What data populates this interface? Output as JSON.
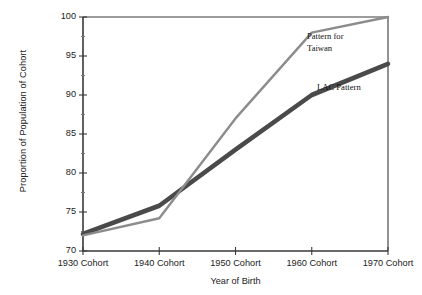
{
  "chart_data": {
    "type": "line",
    "title": "",
    "subtitle": "",
    "xlabel": "Year of Birth",
    "ylabel": "Proportion of Population of Cohort",
    "categories": [
      "1930 Cohort",
      "1940 Cohort",
      "1950 Cohort",
      "1960 Cohort",
      "1970 Cohort"
    ],
    "x_tick_labels": [
      "1930 Cohort",
      "1940 Cohort",
      "1950 Cohort",
      "1960 Cohort",
      "1970 Cohort"
    ],
    "y_tick_labels": [
      "70",
      "75",
      "80",
      "85",
      "90",
      "95",
      "100"
    ],
    "y_tick_values": [
      70,
      75,
      80,
      85,
      90,
      95,
      100
    ],
    "y_minor_tick_values": [
      72.5,
      77.5,
      82.5,
      87.5,
      92.5,
      97.5
    ],
    "ylim": [
      70,
      100
    ],
    "xlim": [
      0,
      4
    ],
    "grid": false,
    "legend_position": "inline-annotation",
    "series": [
      {
        "name": "Pattern for Taiwan",
        "label_lines": [
          "Pattern for",
          "Taiwan"
        ],
        "color": "#8c8c8c",
        "line_width": 2.4,
        "values": [
          72.0,
          74.2,
          87.0,
          98.0,
          100.0
        ]
      },
      {
        "name": "LAC Pattern",
        "label_lines": [
          "LAC Pattern"
        ],
        "color": "#4a4a4a",
        "line_width": 4.6,
        "values": [
          72.2,
          75.8,
          83.0,
          90.0,
          94.0
        ]
      }
    ],
    "annotations": [
      {
        "text": "Pattern for Taiwan",
        "series": "Pattern for Taiwan"
      },
      {
        "text": "LAC Pattern",
        "series": "LAC Pattern"
      }
    ]
  },
  "axis": {
    "line_color": "#3a3a3a",
    "frame_top_visible": true,
    "frame_right_visible": true
  },
  "notes": {
    "taiwan_line1": "Pattern for",
    "taiwan_line2": "Taiwan",
    "lac_line1": "LAC Pattern"
  }
}
